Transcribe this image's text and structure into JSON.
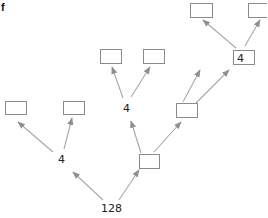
{
  "panel_label": "f",
  "colors": {
    "box_stroke": "#8a8a8a",
    "edge": "#a8a8a8",
    "text": "#222222"
  },
  "labels": {
    "root": "128",
    "branch_left": "4",
    "branch_mid": "4",
    "branch_top": "4"
  },
  "boxes": [
    {
      "id": "b1",
      "x": 5,
      "y": 101,
      "w": 21,
      "h": 13
    },
    {
      "id": "b2",
      "x": 63,
      "y": 101,
      "w": 21,
      "h": 13
    },
    {
      "id": "b3",
      "x": 100,
      "y": 49,
      "w": 21,
      "h": 14
    },
    {
      "id": "b4",
      "x": 143,
      "y": 49,
      "w": 21,
      "h": 14
    },
    {
      "id": "b5",
      "x": 139,
      "y": 154,
      "w": 20,
      "h": 14
    },
    {
      "id": "b6",
      "x": 176,
      "y": 103,
      "w": 21,
      "h": 14
    },
    {
      "id": "b7",
      "x": 190,
      "y": 3,
      "w": 22,
      "h": 14
    },
    {
      "id": "b8",
      "x": 248,
      "y": 3,
      "w": 22,
      "h": 14
    },
    {
      "id": "b9",
      "x": 233,
      "y": 50,
      "w": 21,
      "h": 14
    }
  ]
}
